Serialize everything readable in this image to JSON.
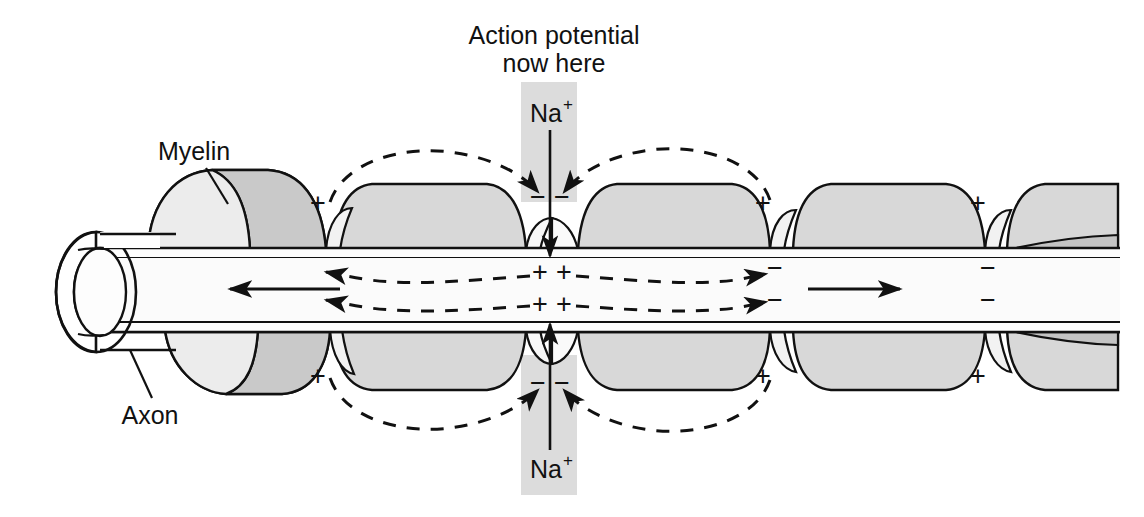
{
  "figure": {
    "type": "biology-diagram"
  },
  "colors": {
    "myelin_light": "#e0e0e0",
    "myelin_mid": "#d2d2d2",
    "myelin_dark": "#bdbdbd",
    "axoplasm": "#fbfbfb",
    "band_gray": "#dcdcdc",
    "stroke": "#111111",
    "background": "#ffffff"
  },
  "annotations": {
    "action_potential": {
      "line1": "Action potential",
      "line2": "now here"
    },
    "myelin_label": "Myelin",
    "axon_label": "Axon",
    "sodium_top": {
      "element": "Na",
      "charge": "+"
    },
    "sodium_bottom": {
      "element": "Na",
      "charge": "+"
    }
  },
  "charges": {
    "outside_top": [
      {
        "symbol": "+",
        "x": 318,
        "y": 212
      },
      {
        "symbol": "−",
        "x": 538,
        "y": 206
      },
      {
        "symbol": "−",
        "x": 562,
        "y": 206
      },
      {
        "symbol": "+",
        "x": 763,
        "y": 212
      },
      {
        "symbol": "+",
        "x": 978,
        "y": 212
      }
    ],
    "outside_bottom": [
      {
        "symbol": "+",
        "x": 318,
        "y": 385
      },
      {
        "symbol": "−",
        "x": 538,
        "y": 392
      },
      {
        "symbol": "−",
        "x": 562,
        "y": 392
      },
      {
        "symbol": "+",
        "x": 763,
        "y": 385
      },
      {
        "symbol": "+",
        "x": 978,
        "y": 385
      }
    ],
    "inside_upper": [
      {
        "symbol": "+",
        "x": 540,
        "y": 281
      },
      {
        "symbol": "+",
        "x": 564,
        "y": 281
      },
      {
        "symbol": "−",
        "x": 775,
        "y": 277
      },
      {
        "symbol": "−",
        "x": 988,
        "y": 277
      }
    ],
    "inside_lower": [
      {
        "symbol": "+",
        "x": 540,
        "y": 311
      },
      {
        "symbol": "+",
        "x": 564,
        "y": 311
      },
      {
        "symbol": "−",
        "x": 775,
        "y": 307
      },
      {
        "symbol": "−",
        "x": 988,
        "y": 307
      }
    ]
  },
  "flow": {
    "left_arrow_direction": "left",
    "right_arrow_direction": "right",
    "description": "Local current loops spread from the active node in both directions"
  },
  "legend": {
    "node_count": 5,
    "myelin_segment_count": 5
  }
}
